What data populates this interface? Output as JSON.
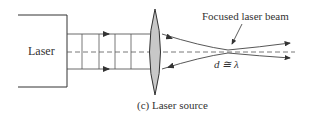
{
  "diagram": {
    "source_label": "Laser",
    "beam_label": "Focused laser beam",
    "spot_label": "d ≅ λ",
    "caption": "(c)  Laser source",
    "colors": {
      "line": "#333333",
      "lens_fill": "#c8c8c8"
    }
  }
}
